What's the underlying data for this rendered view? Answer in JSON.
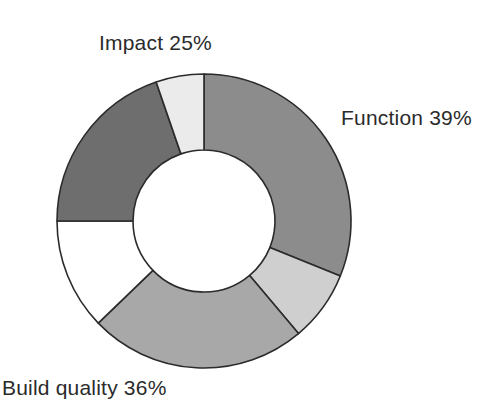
{
  "chart_data": {
    "type": "pie",
    "variant": "donut",
    "title": "",
    "subtitle": "",
    "xlabel": "",
    "ylabel": "",
    "legend_position": "none",
    "grid": false,
    "center": {
      "x": 204,
      "y": 221
    },
    "outer_radius": 147,
    "inner_radius": 71,
    "start_angle_deg": 0,
    "direction": "clockwise",
    "stroke_color": "#2b2b2b",
    "background": "#ffffff",
    "labels": [
      "Function",
      "Build quality",
      "Impact"
    ],
    "values": [
      39,
      36,
      25
    ],
    "categories": [
      "Function",
      "Build quality",
      "Impact"
    ],
    "annotations": [
      {
        "text": "Function 39%",
        "x": 341,
        "y": 106
      },
      {
        "text": "Build quality 36%",
        "x": 2,
        "y": 376
      },
      {
        "text": "Impact 25%",
        "x": 99,
        "y": 31
      }
    ],
    "segments": [
      {
        "name": "function-main",
        "group": "Function",
        "start_deg": 0,
        "end_deg": 112,
        "color": "#8c8c8c"
      },
      {
        "name": "function-sub",
        "group": "Function",
        "start_deg": 112,
        "end_deg": 140,
        "color": "#cfcfcf"
      },
      {
        "name": "build-quality-main",
        "group": "Build quality",
        "start_deg": 140,
        "end_deg": 226,
        "color": "#a8a8a8"
      },
      {
        "name": "build-quality-sub",
        "group": "Build quality",
        "start_deg": 226,
        "end_deg": 270,
        "color": "#ffffff"
      },
      {
        "name": "impact-main",
        "group": "Impact",
        "start_deg": 270,
        "end_deg": 341,
        "color": "#6e6e6e"
      },
      {
        "name": "impact-sub",
        "group": "Impact",
        "start_deg": 341,
        "end_deg": 360,
        "color": "#ebebeb"
      }
    ]
  },
  "chart": {
    "labels": {
      "impact": "Impact 25%",
      "function": "Function 39%",
      "build_quality": "Build quality 36%"
    },
    "colors": {
      "function_main": "#8c8c8c",
      "function_sub": "#cfcfcf",
      "build_quality_main": "#a8a8a8",
      "build_quality_sub": "#ffffff",
      "impact_main": "#6e6e6e",
      "impact_sub": "#ebebeb",
      "outline": "#2b2b2b",
      "text": "#2b2b2b",
      "background": "#ffffff"
    }
  }
}
